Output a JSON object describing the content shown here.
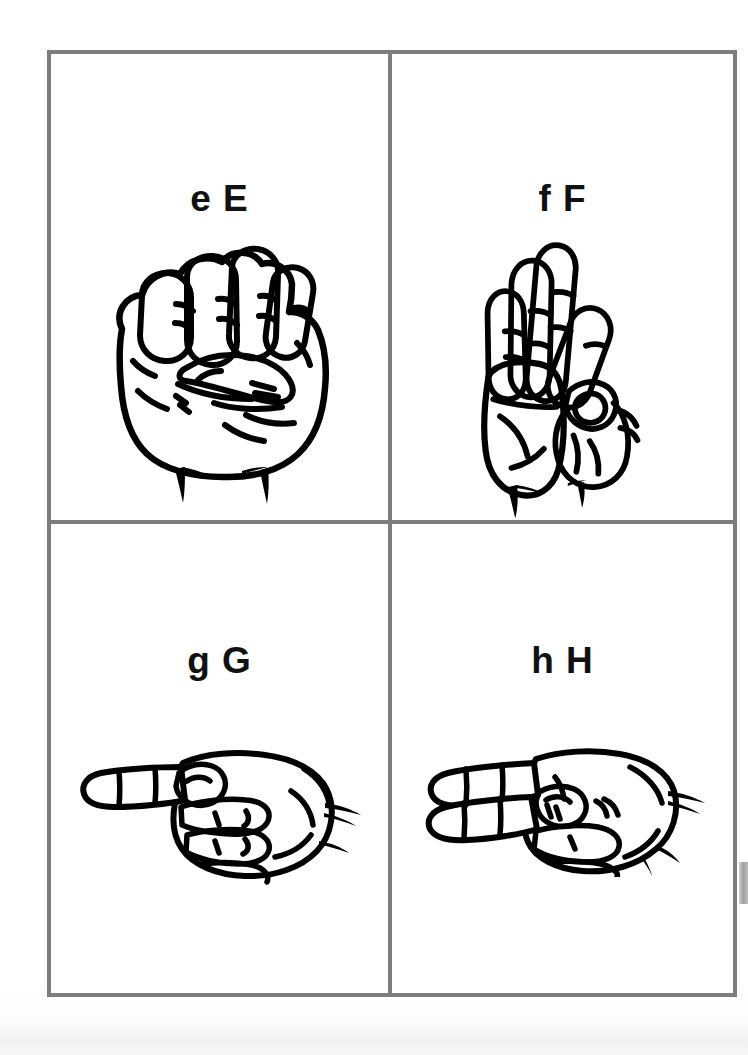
{
  "document": {
    "title": "ASL Fingerspelling Alphabet Chart — Letters E through H",
    "page_background_color": "#ffffff",
    "grid": {
      "rows": 2,
      "columns": 2,
      "border_color": "#7d7d7d",
      "border_width_px": 4
    }
  },
  "cards": [
    {
      "id": "card-e",
      "label": "e E",
      "lowercase": "e",
      "uppercase": "E",
      "letter": "E",
      "position": "top-left",
      "illustration_name": "asl-hand-letter-e",
      "illustration_description": "Closed fist, fingers curled down with fingertips resting on the thumb, thumb tucked horizontally across the front",
      "ink_color": "#000000"
    },
    {
      "id": "card-f",
      "label": "f F",
      "lowercase": "f",
      "uppercase": "F",
      "letter": "F",
      "position": "top-right",
      "illustration_name": "asl-hand-letter-f",
      "illustration_description": "Palm forward with middle, ring and little fingers extended upward while the thumb and index finger touch to form a circle",
      "ink_color": "#000000"
    },
    {
      "id": "card-g",
      "label": "g G",
      "lowercase": "g",
      "uppercase": "G",
      "letter": "G",
      "position": "bottom-left",
      "illustration_name": "asl-hand-letter-g",
      "illustration_description": "Hand held sideways with the index finger pointing horizontally to the left and the thumb alongside it, remaining fingers closed",
      "ink_color": "#000000"
    },
    {
      "id": "card-h",
      "label": "h H",
      "lowercase": "h",
      "uppercase": "H",
      "letter": "H",
      "position": "bottom-right",
      "illustration_name": "asl-hand-letter-h",
      "illustration_description": "Hand held sideways with the index and middle fingers extended together horizontally to the left, remaining fingers closed",
      "ink_color": "#000000"
    }
  ]
}
